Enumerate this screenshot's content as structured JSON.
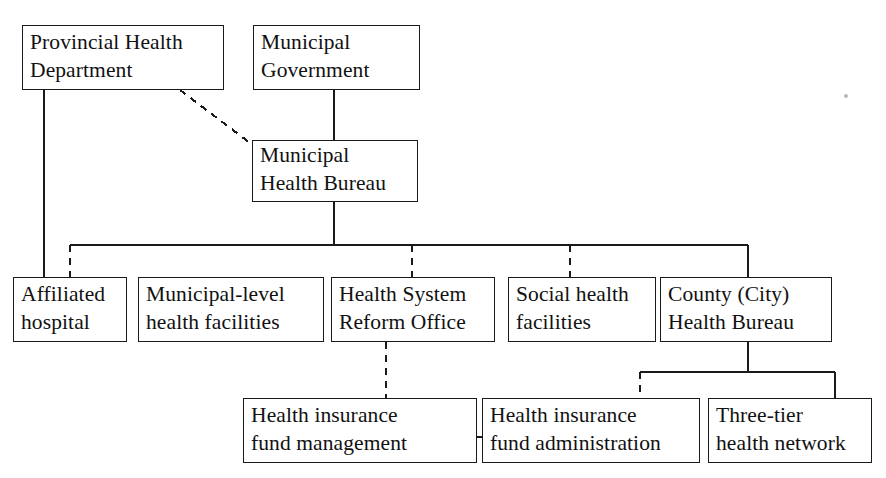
{
  "diagram": {
    "background_color": "#ffffff",
    "line_color": "#1a1a1a",
    "text_color": "#111111",
    "nodes": [
      {
        "id": "provincial-health-department",
        "line1": "Provincial Health",
        "line2": "Department",
        "x": 22,
        "y": 25,
        "w": 202,
        "h": 65
      },
      {
        "id": "municipal-government",
        "line1": "Municipal",
        "line2": "Government",
        "x": 253,
        "y": 25,
        "w": 167,
        "h": 65
      },
      {
        "id": "municipal-health-bureau",
        "line1": "Municipal",
        "line2": "Health Bureau",
        "x": 252,
        "y": 140,
        "w": 166,
        "h": 62
      },
      {
        "id": "affiliated-hospital",
        "line1": "Affiliated",
        "line2": "hospital",
        "x": 13,
        "y": 277,
        "w": 114,
        "h": 65
      },
      {
        "id": "municipal-level-health-facilities",
        "line1": "Municipal-level",
        "line2": "health facilities",
        "x": 138,
        "y": 277,
        "w": 186,
        "h": 65
      },
      {
        "id": "health-system-reform-office",
        "line1": "Health System",
        "line2": "Reform Office",
        "x": 331,
        "y": 277,
        "w": 164,
        "h": 65
      },
      {
        "id": "social-health-facilities",
        "line1": "Social health",
        "line2": "facilities",
        "x": 508,
        "y": 277,
        "w": 148,
        "h": 65
      },
      {
        "id": "county-city-health-bureau",
        "line1": "County (City)",
        "line2": "Health Bureau",
        "x": 660,
        "y": 277,
        "w": 172,
        "h": 65
      },
      {
        "id": "health-insurance-fund-management",
        "line1": "Health insurance",
        "line2": "fund management",
        "x": 243,
        "y": 398,
        "w": 234,
        "h": 65
      },
      {
        "id": "health-insurance-fund-administration",
        "line1": "Health insurance",
        "line2": "fund administration",
        "x": 482,
        "y": 398,
        "w": 218,
        "h": 65
      },
      {
        "id": "three-tier-health-network",
        "line1": "Three-tier",
        "line2": "health network",
        "x": 708,
        "y": 398,
        "w": 164,
        "h": 65
      }
    ],
    "edges": [
      {
        "id": "provincial-to-affiliated-hospital",
        "style": "solid",
        "from": "provincial-health-department",
        "to": "affiliated-hospital"
      },
      {
        "id": "provincial-to-municipal-health-bureau",
        "style": "dashed",
        "from": "provincial-health-department",
        "to": "municipal-health-bureau"
      },
      {
        "id": "municipal-government-to-municipal-health-bureau",
        "style": "solid",
        "from": "municipal-government",
        "to": "municipal-health-bureau"
      },
      {
        "id": "bureau-to-municipal-level-facilities",
        "style": "dashed",
        "from": "municipal-health-bureau",
        "to": "municipal-level-health-facilities"
      },
      {
        "id": "bureau-to-reform-office",
        "style": "dashed",
        "from": "municipal-health-bureau",
        "to": "health-system-reform-office"
      },
      {
        "id": "bureau-to-social-health-facilities",
        "style": "dashed",
        "from": "municipal-health-bureau",
        "to": "social-health-facilities"
      },
      {
        "id": "bureau-to-county-health-bureau",
        "style": "solid",
        "from": "municipal-health-bureau",
        "to": "county-city-health-bureau"
      },
      {
        "id": "reform-office-to-fund-management",
        "style": "dashed",
        "from": "health-system-reform-office",
        "to": "health-insurance-fund-management"
      },
      {
        "id": "county-to-fund-administration",
        "style": "dashed",
        "from": "county-city-health-bureau",
        "to": "health-insurance-fund-administration"
      },
      {
        "id": "county-to-three-tier-network",
        "style": "solid",
        "from": "county-city-health-bureau",
        "to": "three-tier-health-network"
      },
      {
        "id": "fund-management-to-fund-administration",
        "style": "dashed",
        "from": "health-insurance-fund-management",
        "to": "health-insurance-fund-administration"
      }
    ]
  }
}
